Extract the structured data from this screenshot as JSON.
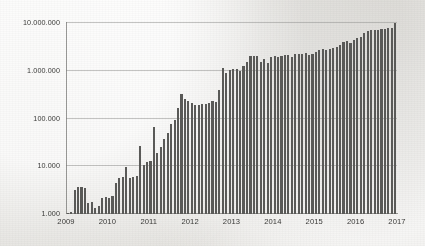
{
  "chart_data": {
    "type": "bar",
    "title": "",
    "subtitle": "",
    "xlabel": "",
    "ylabel": "",
    "yscale": "log",
    "ylim": [
      1000,
      10000000
    ],
    "grid": true,
    "legend": null,
    "axis_colors": {
      "bar": "#5a5a58",
      "grid": "#969694",
      "text": "#3a3a38",
      "background": "#f3f2ef"
    },
    "ytick_labels": [
      "10.000.000",
      "1.000.000",
      "100.000",
      "10.000",
      "1.000"
    ],
    "ytick_values": [
      10000000,
      1000000,
      100000,
      10000,
      1000
    ],
    "xtick_labels": [
      "2009",
      "2010",
      "2011",
      "2012",
      "2013",
      "2014",
      "2015",
      "2016",
      "2017"
    ],
    "xtick_values": [
      2009,
      2010,
      2011,
      2012,
      2013,
      2014,
      2015,
      2016,
      2017
    ],
    "x_start": 2009.0,
    "x_end": 2017.0,
    "n_bars": 96,
    "bar_interval": "monthly",
    "categories": [
      "2009-01",
      "2009-02",
      "2009-03",
      "2009-04",
      "2009-05",
      "2009-06",
      "2009-07",
      "2009-08",
      "2009-09",
      "2009-10",
      "2009-11",
      "2009-12",
      "2010-01",
      "2010-02",
      "2010-03",
      "2010-04",
      "2010-05",
      "2010-06",
      "2010-07",
      "2010-08",
      "2010-09",
      "2010-10",
      "2010-11",
      "2010-12",
      "2011-01",
      "2011-02",
      "2011-03",
      "2011-04",
      "2011-05",
      "2011-06",
      "2011-07",
      "2011-08",
      "2011-09",
      "2011-10",
      "2011-11",
      "2011-12",
      "2012-01",
      "2012-02",
      "2012-03",
      "2012-04",
      "2012-05",
      "2012-06",
      "2012-07",
      "2012-08",
      "2012-09",
      "2012-10",
      "2012-11",
      "2012-12",
      "2013-01",
      "2013-02",
      "2013-03",
      "2013-04",
      "2013-05",
      "2013-06",
      "2013-07",
      "2013-08",
      "2013-09",
      "2013-10",
      "2013-11",
      "2013-12",
      "2014-01",
      "2014-02",
      "2014-03",
      "2014-04",
      "2014-05",
      "2014-06",
      "2014-07",
      "2014-08",
      "2014-09",
      "2014-10",
      "2014-11",
      "2014-12",
      "2015-01",
      "2015-02",
      "2015-03",
      "2015-04",
      "2015-05",
      "2015-06",
      "2015-07",
      "2015-08",
      "2015-09",
      "2015-10",
      "2015-11",
      "2015-12",
      "2016-01",
      "2016-02",
      "2016-03",
      "2016-04",
      "2016-05",
      "2016-06",
      "2016-07",
      "2016-08",
      "2016-09",
      "2016-10",
      "2016-11",
      "2016-12"
    ],
    "values": [
      1050,
      1080,
      3200,
      3600,
      3600,
      3550,
      1700,
      1750,
      1350,
      1500,
      2200,
      2250,
      2200,
      2400,
      4500,
      5800,
      6000,
      9800,
      5700,
      6000,
      6300,
      26000,
      10500,
      12000,
      12800,
      68000,
      19000,
      25000,
      38000,
      50000,
      75000,
      95000,
      165000,
      330000,
      260000,
      235000,
      210000,
      195000,
      195000,
      200000,
      205000,
      215000,
      230000,
      225000,
      390000,
      1150000,
      900000,
      1050000,
      1100000,
      1080000,
      1000000,
      1250000,
      1500000,
      2000000,
      2050000,
      2050000,
      1500000,
      1750000,
      1450000,
      1900000,
      2000000,
      1950000,
      2050000,
      2100000,
      2100000,
      1950000,
      2200000,
      2250000,
      2200000,
      2300000,
      2100000,
      2200000,
      2500000,
      2700000,
      2800000,
      2700000,
      2900000,
      3000000,
      3100000,
      3500000,
      4000000,
      4200000,
      3900000,
      4500000,
      4800000,
      5000000,
      6300000,
      6900000,
      7000000,
      7000000,
      7200000,
      7500000,
      7600000,
      7900000,
      8000000,
      10000000
    ]
  },
  "plot_geometry": {
    "left": 66,
    "right": 397,
    "top": 22,
    "bottom": 213
  }
}
